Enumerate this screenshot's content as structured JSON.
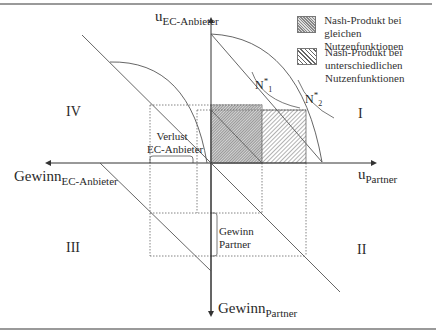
{
  "axes": {
    "y_up": {
      "main": "u",
      "sub": "EC-Anbieter"
    },
    "x_right": {
      "main": "u",
      "sub": "Partner"
    },
    "x_left": {
      "main": "Gewinn",
      "sub": "EC-Anbieter"
    },
    "y_down": {
      "main": "Gewinn",
      "sub": "Partner"
    }
  },
  "quadrants": {
    "q1": "I",
    "q2": "II",
    "q3": "III",
    "q4": "IV"
  },
  "annotations": {
    "verlust_line1": "Verlust",
    "verlust_line2": "EC-Anbieter",
    "gewinn_line1": "Gewinn",
    "gewinn_line2": "Partner",
    "n1_main": "N",
    "n1_sup": "*",
    "n1_sub": "1",
    "n2_main": "N",
    "n2_sup": "*",
    "n2_sub": "2"
  },
  "legend": [
    {
      "line1": "Nash-Produkt bei gleichen",
      "line2": "Nutzenfunktionen",
      "line3": "",
      "pattern": "fine-hatch"
    },
    {
      "line1": "Nash-Produkt bei",
      "line2": "unterschiedlichen",
      "line3": "Nutzenfunktionen",
      "pattern": "diagonal-hatch"
    }
  ],
  "colors": {
    "line": "#555555",
    "frame": "#9a9a9a",
    "fill_equal": "#8a8a8a",
    "fill_diff": "#6a6a6a"
  }
}
